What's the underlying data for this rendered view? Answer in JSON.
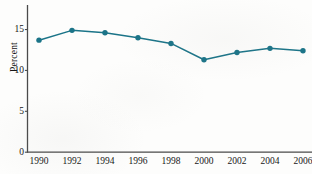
{
  "chart_data": {
    "type": "line",
    "title": "",
    "subtitle": "",
    "xlabel": "",
    "ylabel": "Percent",
    "x": [
      1990,
      1992,
      1994,
      1996,
      1998,
      2000,
      2002,
      2004,
      2006
    ],
    "categories": [
      "1990",
      "1992",
      "1994",
      "1996",
      "1998",
      "2000",
      "2002",
      "2004",
      "2006"
    ],
    "values": [
      13.7,
      14.9,
      14.6,
      14.0,
      13.3,
      11.3,
      12.2,
      12.7,
      12.4
    ],
    "series": [
      {
        "name": "Percent",
        "values": [
          13.7,
          14.9,
          14.6,
          14.0,
          13.3,
          11.3,
          12.2,
          12.7,
          12.4
        ]
      }
    ],
    "ylim": [
      0,
      18
    ],
    "xlim": [
      1989,
      2006.5
    ],
    "ytick_values": [
      0,
      5,
      10,
      15
    ],
    "ytick_labels": [
      "0",
      "5",
      "10",
      "15"
    ],
    "xtick_labels": [
      "1990",
      "1992",
      "1994",
      "1996",
      "1998",
      "2000",
      "2002",
      "2004",
      "2006"
    ],
    "grid": false,
    "legend": "none",
    "marker": "filled-circle",
    "line_color": "#1b7488",
    "marker_color": "#1b7488",
    "axis_color": "#4a4a4a",
    "background_color": "#fdfdfc"
  },
  "axis": {
    "y_title": "Percent",
    "y_ticks": [
      {
        "label": "15",
        "value": 15
      },
      {
        "label": "10",
        "value": 10
      },
      {
        "label": "5",
        "value": 5
      },
      {
        "label": "0",
        "value": 0
      }
    ],
    "x_ticks": [
      {
        "label": "1990",
        "value": 1990
      },
      {
        "label": "1992",
        "value": 1992
      },
      {
        "label": "1994",
        "value": 1994
      },
      {
        "label": "1996",
        "value": 1996
      },
      {
        "label": "1998",
        "value": 1998
      },
      {
        "label": "2000",
        "value": 2000
      },
      {
        "label": "2002",
        "value": 2002
      },
      {
        "label": "2004",
        "value": 2004
      },
      {
        "label": "2006",
        "value": 2006
      }
    ]
  }
}
